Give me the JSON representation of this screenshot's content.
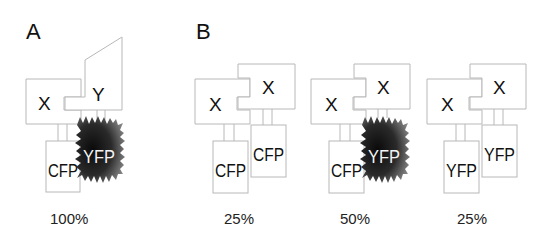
{
  "panels": {
    "A": {
      "label": "A",
      "molecule_1": "X",
      "molecule_2": "Y",
      "fluorophore_1": "CFP",
      "fluorophore_2": "YFP",
      "fret_active": true,
      "percentage": "100%"
    },
    "B": {
      "label": "B",
      "complexes": [
        {
          "molecule_1": "X",
          "molecule_2": "X",
          "fluorophore_1": "CFP",
          "fluorophore_2": "CFP",
          "fret_active": false,
          "percentage": "25%"
        },
        {
          "molecule_1": "X",
          "molecule_2": "X",
          "fluorophore_1": "CFP",
          "fluorophore_2": "YFP",
          "fret_active": true,
          "percentage": "50%"
        },
        {
          "molecule_1": "X",
          "molecule_2": "X",
          "fluorophore_1": "YFP",
          "fluorophore_2": "YFP",
          "fret_active": false,
          "percentage": "25%"
        }
      ]
    }
  },
  "colors": {
    "outline": "#b8b8b8",
    "text": "#111111",
    "burst_dark": "#111111",
    "burst_light": "#7a7a7a"
  }
}
